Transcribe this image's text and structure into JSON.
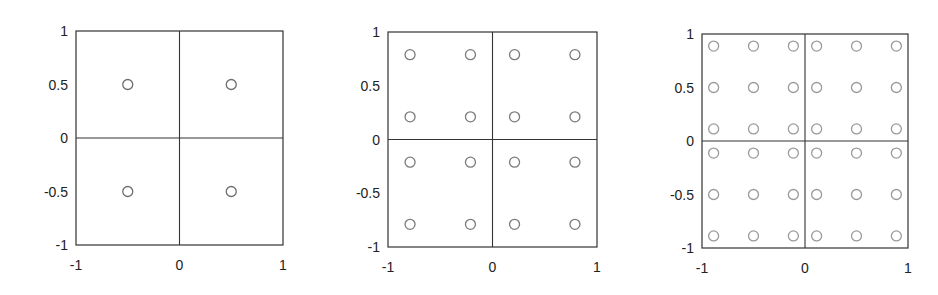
{
  "figure": {
    "panels": [
      {
        "id": "p1",
        "box": {
          "x": 76,
          "y": 31,
          "w": 207,
          "h": 214
        },
        "marker_color": "#6e6e6e"
      },
      {
        "id": "p2",
        "box": {
          "x": 388,
          "y": 32,
          "w": 209,
          "h": 215
        },
        "marker_color": "#7a7a7a"
      },
      {
        "id": "p3",
        "box": {
          "x": 702,
          "y": 34,
          "w": 206,
          "h": 214
        },
        "marker_color": "#9a9a9a"
      }
    ],
    "axis_color": "#333333",
    "tick_color": "#222222"
  },
  "chart_data": [
    {
      "type": "scatter",
      "title": "",
      "xlabel": "",
      "ylabel": "",
      "xlim": [
        -1,
        1
      ],
      "ylim": [
        -1,
        1
      ],
      "grid": false,
      "dividers": {
        "x": [
          0
        ],
        "y": [
          0
        ]
      },
      "xticks": [
        -1,
        0,
        1
      ],
      "xtick_labels": [
        "-1",
        "0",
        "1"
      ],
      "yticks": [
        -1,
        -0.5,
        0,
        0.5,
        1
      ],
      "ytick_labels": [
        "-1",
        "-0.5",
        "0",
        "0.5",
        "1"
      ],
      "marker": "open-circle",
      "series": [
        {
          "name": "points",
          "coords_1d": [
            -0.5,
            0.5
          ]
        }
      ],
      "points": [
        [
          -0.5,
          0.5
        ],
        [
          0.5,
          0.5
        ],
        [
          -0.5,
          -0.5
        ],
        [
          0.5,
          -0.5
        ]
      ]
    },
    {
      "type": "scatter",
      "title": "",
      "xlabel": "",
      "ylabel": "",
      "xlim": [
        -1,
        1
      ],
      "ylim": [
        -1,
        1
      ],
      "grid": false,
      "dividers": {
        "x": [
          0
        ],
        "y": [
          0
        ]
      },
      "xticks": [
        -1,
        0,
        1
      ],
      "xtick_labels": [
        "-1",
        "0",
        "1"
      ],
      "yticks": [
        -1,
        -0.5,
        0,
        0.5,
        1
      ],
      "ytick_labels": [
        "-1",
        "-0.5",
        "0",
        "0.5",
        "1"
      ],
      "marker": "open-circle",
      "series": [
        {
          "name": "points",
          "coords_1d": [
            -0.789,
            -0.211,
            0.211,
            0.789
          ]
        }
      ],
      "points": "4x4 grid of coords_1d × coords_1d"
    },
    {
      "type": "scatter",
      "title": "",
      "xlabel": "",
      "ylabel": "",
      "xlim": [
        -1,
        1
      ],
      "ylim": [
        -1,
        1
      ],
      "grid": false,
      "dividers": {
        "x": [
          0
        ],
        "y": [
          0
        ]
      },
      "xticks": [
        -1,
        0,
        1
      ],
      "xtick_labels": [
        "-1",
        "0",
        "1"
      ],
      "yticks": [
        -1,
        -0.5,
        0,
        0.5,
        1
      ],
      "ytick_labels": [
        "-1",
        "-0.5",
        "0",
        "0.5",
        "1"
      ],
      "marker": "open-circle",
      "series": [
        {
          "name": "points",
          "coords_1d": [
            -0.887,
            -0.5,
            -0.113,
            0.113,
            0.5,
            0.887
          ]
        }
      ],
      "points": "6x6 grid of coords_1d × coords_1d"
    }
  ]
}
